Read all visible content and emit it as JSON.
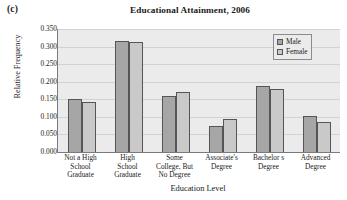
{
  "panel": {
    "label": "(c)"
  },
  "legend": {
    "position": "top-right",
    "entries": [
      {
        "name": "Male",
        "swatch": "male",
        "color": "#a6a6a6"
      },
      {
        "name": "Female",
        "swatch": "female",
        "color": "#c9c9c9"
      }
    ]
  },
  "axis": {
    "y_ticks": [
      "0.350",
      "0.300",
      "0.250",
      "0.200",
      "0.150",
      "0.100",
      "0.050",
      "0.000"
    ]
  },
  "chart_data": {
    "type": "bar",
    "title": "Educational Attainment, 2006",
    "xlabel": "Education Level",
    "ylabel": "Relative Frequency",
    "ylim": [
      0.0,
      0.35
    ],
    "ytick_step": 0.05,
    "grid": true,
    "legend_position": "top-right",
    "categories": [
      "Not a High School Graduate",
      "High School Graduate",
      "Some College, But No Degree",
      "Associate's Degree",
      "Bachelor s Degree",
      "Advanced Degree"
    ],
    "category_lines": [
      [
        "Not a High",
        "School",
        "Graduate"
      ],
      [
        "High",
        "School",
        "Graduate"
      ],
      [
        "Some",
        "College, But",
        "No Degree"
      ],
      [
        "Associate's",
        "Degree"
      ],
      [
        "Bachelor s",
        "Degree"
      ],
      [
        "Advanced",
        "Degree"
      ]
    ],
    "series": [
      {
        "name": "Male",
        "color": "#a6a6a6",
        "values": [
          0.151,
          0.316,
          0.158,
          0.073,
          0.188,
          0.103
        ]
      },
      {
        "name": "Female",
        "color": "#c9c9c9",
        "values": [
          0.143,
          0.312,
          0.172,
          0.095,
          0.18,
          0.084
        ]
      }
    ]
  }
}
